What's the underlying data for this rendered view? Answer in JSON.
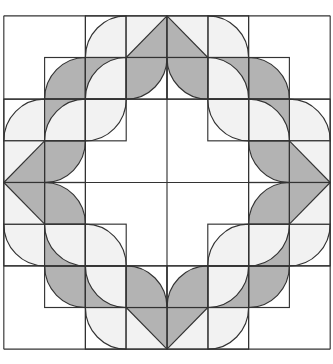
{
  "diagram": {
    "grid_units": 8,
    "colors": {
      "background": "#ffffff",
      "light": "#f2f2f2",
      "dark": "#b3b3b3",
      "line": "#333333"
    },
    "quadrant_tiles": [
      {
        "cell": [
          2,
          0
        ],
        "type": "pie",
        "center": [
          3,
          1
        ],
        "fill": "light"
      },
      {
        "cell": [
          3,
          0
        ],
        "type": "triangle-diag",
        "light": "upper-left",
        "dark": "lower-right"
      },
      {
        "cell": [
          1,
          1
        ],
        "type": "pie",
        "center": [
          2,
          2
        ],
        "fill": "dark"
      },
      {
        "cell": [
          2,
          1
        ],
        "type": "pie-on-bg",
        "bg": "dark",
        "center": [
          3,
          2
        ],
        "fill": "light"
      },
      {
        "cell": [
          3,
          1
        ],
        "type": "pie",
        "center": [
          3,
          1
        ],
        "fill": "dark"
      },
      {
        "cell": [
          0,
          2
        ],
        "type": "pie",
        "center": [
          1,
          3
        ],
        "fill": "light"
      },
      {
        "cell": [
          1,
          2
        ],
        "type": "pie-on-bg",
        "bg": "dark",
        "center": [
          2,
          3
        ],
        "fill": "light"
      },
      {
        "cell": [
          2,
          2
        ],
        "type": "pie",
        "center": [
          2,
          2
        ],
        "fill": "light"
      },
      {
        "cell": [
          0,
          3
        ],
        "type": "triangle-diag",
        "light": "upper-left",
        "dark": "lower-right"
      },
      {
        "cell": [
          1,
          3
        ],
        "type": "pie",
        "center": [
          1,
          3
        ],
        "fill": "dark"
      }
    ]
  }
}
